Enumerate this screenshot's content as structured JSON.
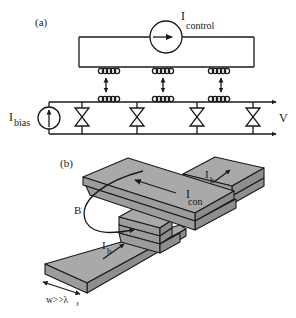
{
  "panel_a": {
    "label": "(a)",
    "control_source": {
      "symbol": "I",
      "subscript": "control"
    },
    "bias_source": {
      "symbol": "I",
      "subscript": "bias"
    },
    "output_label": "V",
    "coupling_coils": 3,
    "junctions": 4
  },
  "panel_b": {
    "label": "(b)",
    "control_current": {
      "symbol": "I",
      "subscript": "con"
    },
    "bias_current_top": {
      "symbol": "I",
      "subscript": "b"
    },
    "bias_current_bottom": {
      "symbol": "I",
      "subscript": "b"
    },
    "field_label": "B",
    "width_label": {
      "main": "w>>λ",
      "subscript": "J"
    }
  }
}
